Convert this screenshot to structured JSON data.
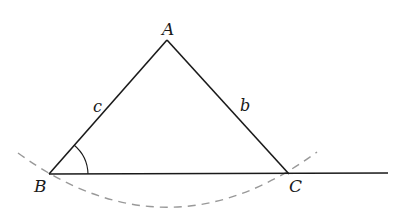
{
  "diagram": {
    "type": "geometry-construction",
    "vertices": {
      "A": {
        "label": "A",
        "x": 167,
        "y": 40
      },
      "B": {
        "label": "B",
        "x": 49,
        "y": 174
      },
      "C": {
        "label": "C",
        "x": 289,
        "y": 174
      }
    },
    "sides": {
      "c": {
        "label": "c",
        "from": "A",
        "to": "B"
      },
      "b": {
        "label": "b",
        "from": "A",
        "to": "C"
      }
    },
    "baseline": {
      "from": "B",
      "to_x": 388
    },
    "angle_mark": {
      "at": "B",
      "radius": 39
    },
    "arc": {
      "style": "dashed",
      "color": "#999999",
      "through": [
        "B",
        "C"
      ]
    },
    "colors": {
      "line": "#1a1a1a",
      "dashed_arc": "#999999",
      "background": "#ffffff"
    }
  }
}
